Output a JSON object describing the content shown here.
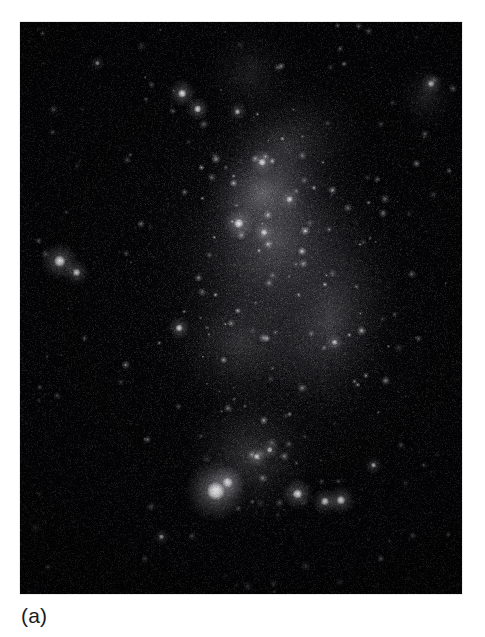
{
  "figure": {
    "caption": "(a)",
    "media_type": "monochrome astronomical photograph",
    "page_background": "#ffffff",
    "plate": {
      "x": 20,
      "y": 22,
      "width": 442,
      "height": 572,
      "background_color": "#050507",
      "sky_color": "#0a0a0c",
      "star_color": "#ffffff",
      "grain": {
        "density": 0.42,
        "intensity": 0.55
      },
      "diffuse_regions": [
        {
          "name": "upper-bar-glow",
          "cx": 0.6,
          "cy": 0.22,
          "rx": 0.2,
          "ry": 0.12,
          "intensity": 0.3,
          "angle": -28
        },
        {
          "name": "central-bar",
          "cx": 0.58,
          "cy": 0.38,
          "rx": 0.24,
          "ry": 0.16,
          "intensity": 0.42,
          "angle": -35
        },
        {
          "name": "bar-core",
          "cx": 0.55,
          "cy": 0.3,
          "rx": 0.15,
          "ry": 0.1,
          "intensity": 0.52,
          "angle": -30
        },
        {
          "name": "east-arm-glow",
          "cx": 0.7,
          "cy": 0.52,
          "rx": 0.16,
          "ry": 0.2,
          "intensity": 0.34,
          "angle": 15
        },
        {
          "name": "mid-halo",
          "cx": 0.5,
          "cy": 0.56,
          "rx": 0.18,
          "ry": 0.13,
          "intensity": 0.26,
          "angle": -20
        },
        {
          "name": "south-arm-glow",
          "cx": 0.52,
          "cy": 0.76,
          "rx": 0.17,
          "ry": 0.13,
          "intensity": 0.32,
          "angle": -50
        },
        {
          "name": "outer-halo",
          "cx": 0.58,
          "cy": 0.46,
          "rx": 0.34,
          "ry": 0.38,
          "intensity": 0.16,
          "angle": -15
        },
        {
          "name": "north-plume",
          "cx": 0.52,
          "cy": 0.09,
          "rx": 0.12,
          "ry": 0.09,
          "intensity": 0.18,
          "angle": -40
        },
        {
          "name": "east-edge-wisp",
          "cx": 0.92,
          "cy": 0.13,
          "rx": 0.07,
          "ry": 0.06,
          "intensity": 0.2,
          "angle": 0
        }
      ],
      "bright_knots": [
        {
          "name": "30-dor-analog",
          "cx": 0.443,
          "cy": 0.82,
          "r": 9.5,
          "intensity": 1.0
        },
        {
          "name": "knot-s-companion",
          "cx": 0.47,
          "cy": 0.805,
          "r": 5.5,
          "intensity": 0.78
        },
        {
          "name": "knot-s-east-a",
          "cx": 0.628,
          "cy": 0.825,
          "r": 5.0,
          "intensity": 0.82
        },
        {
          "name": "knot-s-east-b",
          "cx": 0.69,
          "cy": 0.838,
          "r": 4.2,
          "intensity": 0.74
        },
        {
          "name": "knot-s-east-c",
          "cx": 0.726,
          "cy": 0.836,
          "r": 4.6,
          "intensity": 0.76
        },
        {
          "name": "knot-s-arc-a",
          "cx": 0.536,
          "cy": 0.76,
          "r": 3.4,
          "intensity": 0.62
        },
        {
          "name": "knot-s-arc-b",
          "cx": 0.565,
          "cy": 0.748,
          "r": 3.0,
          "intensity": 0.58
        },
        {
          "name": "west-bright-pair",
          "cx": 0.09,
          "cy": 0.418,
          "r": 6.0,
          "intensity": 0.8
        },
        {
          "name": "west-pair-b",
          "cx": 0.128,
          "cy": 0.438,
          "r": 4.0,
          "intensity": 0.66
        },
        {
          "name": "mid-left-star",
          "cx": 0.36,
          "cy": 0.535,
          "r": 3.8,
          "intensity": 0.66
        },
        {
          "name": "bar-knot-a",
          "cx": 0.495,
          "cy": 0.352,
          "r": 5.0,
          "intensity": 0.76
        },
        {
          "name": "bar-knot-b",
          "cx": 0.552,
          "cy": 0.368,
          "r": 3.6,
          "intensity": 0.64
        },
        {
          "name": "bar-knot-c",
          "cx": 0.548,
          "cy": 0.245,
          "r": 4.0,
          "intensity": 0.68
        },
        {
          "name": "bar-knot-d",
          "cx": 0.61,
          "cy": 0.31,
          "r": 3.4,
          "intensity": 0.6
        },
        {
          "name": "north-star-a",
          "cx": 0.367,
          "cy": 0.125,
          "r": 4.4,
          "intensity": 0.8
        },
        {
          "name": "north-star-b",
          "cx": 0.402,
          "cy": 0.152,
          "r": 3.8,
          "intensity": 0.72
        },
        {
          "name": "north-star-c",
          "cx": 0.492,
          "cy": 0.157,
          "r": 3.0,
          "intensity": 0.58
        },
        {
          "name": "ne-edge-star",
          "cx": 0.93,
          "cy": 0.108,
          "r": 3.6,
          "intensity": 0.66
        },
        {
          "name": "mid-right-star",
          "cx": 0.712,
          "cy": 0.56,
          "r": 3.0,
          "intensity": 0.56
        },
        {
          "name": "se-faint-star",
          "cx": 0.8,
          "cy": 0.775,
          "r": 2.8,
          "intensity": 0.54
        },
        {
          "name": "sw-field-star",
          "cx": 0.32,
          "cy": 0.9,
          "r": 2.6,
          "intensity": 0.5
        },
        {
          "name": "nw-field-star",
          "cx": 0.175,
          "cy": 0.072,
          "r": 2.4,
          "intensity": 0.46
        }
      ],
      "field_star_count": 520
    }
  }
}
